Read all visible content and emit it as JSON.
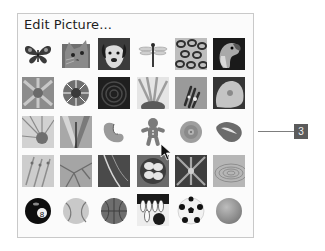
{
  "panel": {
    "title": "Edit Picture..."
  },
  "callout": {
    "label": "3"
  },
  "grid": {
    "columns": 6,
    "rows": 6,
    "items": [
      [
        "butterfly",
        "cat",
        "dog",
        "dragonfly",
        "leopard-fur",
        "parrot"
      ],
      [
        "flower-petals",
        "daisy",
        "dark-swirl",
        "sunflower",
        "hand-flower",
        "rose"
      ],
      [
        "petal-closeup",
        "leaves",
        "fortune-cookie",
        "gingerbread-man",
        "target-disc",
        "lips"
      ],
      [
        "feathers",
        "leaf-veins",
        "lightning",
        "eggs-nest",
        "snowflake-abstract",
        "ripples"
      ],
      [
        "billiard-ball",
        "baseball",
        "basketball",
        "bowling",
        "soccer-ball",
        "tennis-ball"
      ]
    ]
  }
}
